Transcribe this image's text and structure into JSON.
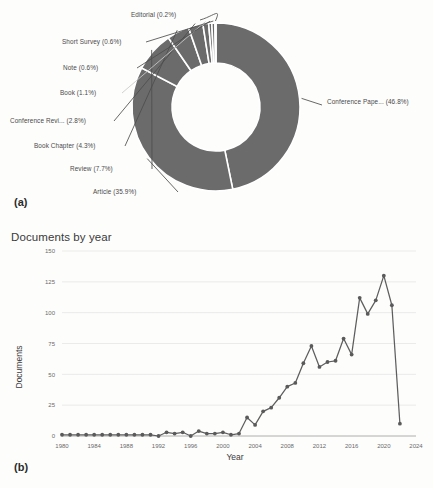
{
  "figure": {
    "panel_a_tag": "(a)",
    "panel_b_tag": "(b)"
  },
  "colors": {
    "slice_fill": "#6b6b6b",
    "slice_separator": "#ffffff",
    "line_stroke": "#5e5e5e",
    "grid": "#e3e3e3",
    "axis": "#9a9a9a",
    "text": "#4a4a4a",
    "background": "#fdfdfc"
  },
  "donut_labels": {
    "editorial": "Editorial (0.2%)",
    "short_survey": "Short Survey (0.6%)",
    "note": "Note (0.6%)",
    "book": "Book (1.1%)",
    "conference_review": "Conference Revi... (2.8%)",
    "book_chapter": "Book Chapter (4.3%)",
    "review": "Review (7.7%)",
    "article": "Article (35.9%)",
    "conference_paper": "Conference Pape... (46.8%)"
  },
  "line_chart_text": {
    "title": "Documents by year",
    "ylabel": "Documents",
    "xlabel": "Year"
  },
  "chart_data": [
    {
      "type": "pie",
      "title": "",
      "subtype": "donut",
      "hole_ratio": 0.52,
      "legend": "outside-labels-with-leader-lines",
      "units": "percent",
      "categories": [
        "Conference Paper",
        "Article",
        "Review",
        "Book Chapter",
        "Conference Review",
        "Book",
        "Note",
        "Short Survey",
        "Editorial"
      ],
      "labels": [
        "Conference Pape... (46.8%)",
        "Article (35.9%)",
        "Review (7.7%)",
        "Book Chapter (4.3%)",
        "Conference Revi... (2.8%)",
        "Book (1.1%)",
        "Note (0.6%)",
        "Short Survey (0.6%)",
        "Editorial (0.2%)"
      ],
      "values": [
        46.8,
        35.9,
        7.7,
        4.3,
        2.8,
        1.1,
        0.6,
        0.6,
        0.2
      ]
    },
    {
      "type": "line",
      "title": "Documents by year",
      "xlabel": "Year",
      "ylabel": "Documents",
      "xlim": [
        1980,
        2024
      ],
      "ylim": [
        0,
        150
      ],
      "xticks": [
        1980,
        1984,
        1988,
        1992,
        1996,
        2000,
        2004,
        2008,
        2012,
        2016,
        2020,
        2024
      ],
      "yticks": [
        0,
        25,
        50,
        75,
        100,
        125,
        150
      ],
      "grid": "horizontal",
      "markers": true,
      "x": [
        1980,
        1981,
        1982,
        1983,
        1984,
        1985,
        1986,
        1987,
        1988,
        1989,
        1990,
        1991,
        1992,
        1993,
        1994,
        1995,
        1996,
        1997,
        1998,
        1999,
        2000,
        2001,
        2002,
        2003,
        2004,
        2005,
        2006,
        2007,
        2008,
        2009,
        2010,
        2011,
        2012,
        2013,
        2014,
        2015,
        2016,
        2017,
        2018,
        2019,
        2020,
        2021,
        2022
      ],
      "values": [
        1,
        1,
        1,
        1,
        1,
        1,
        1,
        1,
        1,
        1,
        1,
        1,
        0,
        3,
        2,
        3,
        0,
        4,
        2,
        2,
        3,
        1,
        2,
        15,
        9,
        20,
        23,
        31,
        40,
        43,
        59,
        73,
        56,
        60,
        61,
        79,
        66,
        112,
        99,
        110,
        130,
        106,
        10
      ]
    }
  ]
}
